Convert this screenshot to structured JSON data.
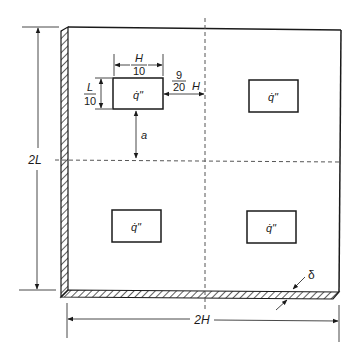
{
  "diagram": {
    "sources": [
      {
        "id": "top-left",
        "label": "q̇\""
      },
      {
        "id": "top-right",
        "label": "q̇\""
      },
      {
        "id": "bottom-left",
        "label": "q̇\""
      },
      {
        "id": "bottom-right",
        "label": "q̇\""
      }
    ],
    "dimensions": {
      "height_total": "2L",
      "width_total": "2H",
      "source_width_num": "H",
      "source_width_den": "10",
      "source_height_num": "L",
      "source_height_den": "10",
      "offset_num": "9",
      "offset_den": "20",
      "offset_var": "H",
      "gap_label": "a",
      "thickness_label": "δ"
    },
    "colors": {
      "line": "#1a1a1a",
      "dashed": "#555555",
      "background": "#ffffff"
    }
  }
}
